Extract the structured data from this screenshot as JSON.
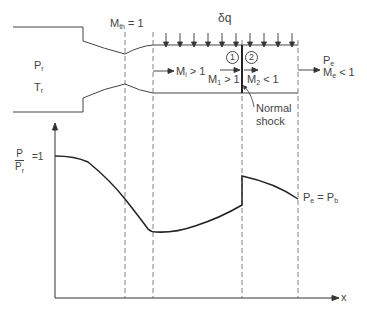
{
  "diagram": {
    "throat_label": {
      "symbol": "M",
      "sub": "th",
      "rest": " = 1"
    },
    "heat_label": "δq",
    "reservoir": {
      "pressure": {
        "symbol": "P",
        "sub": "r"
      },
      "temperature": {
        "symbol": "T",
        "sub": "r"
      }
    },
    "inlet_mach": {
      "symbol": "M",
      "sub": "i",
      "rest": " > 1"
    },
    "station_1": {
      "marker": "1",
      "symbol": "M",
      "sub": "1",
      "rest": " > 1"
    },
    "station_2": {
      "marker": "2",
      "symbol": "M",
      "sub": "2",
      "rest": " < 1"
    },
    "exit": {
      "pressure": {
        "symbol": "P",
        "sub": "e"
      },
      "mach": {
        "symbol": "M",
        "sub": "e",
        "rest": " < 1"
      }
    },
    "shock_label_line1": "Normal",
    "shock_label_line2": "shock"
  },
  "plot": {
    "y_label_num": "P",
    "y_label_den": {
      "symbol": "P",
      "sub": "r"
    },
    "y_label_rest": "=1",
    "x_label": "x",
    "exit_condition": {
      "p1": "P",
      "s1": "e",
      "mid": " = ",
      "p2": "P",
      "s2": "b"
    }
  },
  "colors": {
    "line": "#333333",
    "dashed": "#666666",
    "text": "#444444"
  }
}
